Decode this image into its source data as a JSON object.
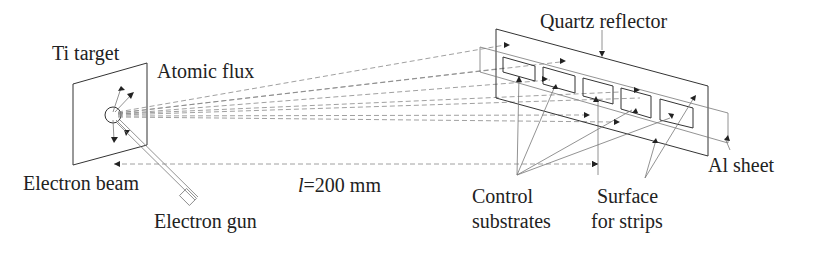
{
  "diagram": {
    "labels": {
      "ti_target": "Ti target",
      "atomic_flux": "Atomic flux",
      "electron_beam": "Electron beam",
      "electron_gun": "Electron gun",
      "distance": "l=200 mm",
      "distance_var": "l",
      "distance_val": "=200 mm",
      "quartz_reflector": "Quartz reflector",
      "control_substrates_1": "Control",
      "control_substrates_2": "substrates",
      "surface_strips_1": "Surface",
      "surface_strips_2": "for strips",
      "al_sheet": "Al sheet"
    },
    "colors": {
      "line": "#333333",
      "text": "#222222",
      "background": "#ffffff"
    }
  }
}
